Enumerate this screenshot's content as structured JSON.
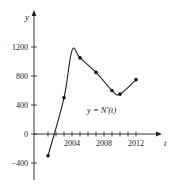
{
  "chart_data": {
    "type": "line",
    "title": "",
    "xlabel": "t",
    "ylabel": "y",
    "curve_label": "y = N'(t)",
    "x": [
      2001,
      2003,
      2004,
      2005,
      2007,
      2009,
      2010,
      2012
    ],
    "series": [
      {
        "name": "y = N'(t)",
        "values": [
          -300,
          500,
          1150,
          1050,
          850,
          600,
          550,
          750
        ],
        "marked_points": [
          {
            "x": 2001,
            "y": -300
          },
          {
            "x": 2003,
            "y": 500
          },
          {
            "x": 2005,
            "y": 1050
          },
          {
            "x": 2007,
            "y": 850
          },
          {
            "x": 2009,
            "y": 600
          },
          {
            "x": 2010,
            "y": 550
          },
          {
            "x": 2012,
            "y": 750
          }
        ]
      }
    ],
    "x_ticks": [
      2001,
      2002,
      2003,
      2004,
      2005,
      2006,
      2007,
      2008,
      2009,
      2010,
      2011,
      2012
    ],
    "x_tick_labels": [
      "2004",
      "2008",
      "2012"
    ],
    "y_ticks": [
      -400,
      0,
      400,
      800,
      1200
    ],
    "y_tick_labels": [
      "-400",
      "0",
      "400",
      "800",
      "1200"
    ],
    "xlim": [
      2000,
      2013
    ],
    "ylim": [
      -500,
      1500
    ],
    "grid": false,
    "legend": "none"
  }
}
